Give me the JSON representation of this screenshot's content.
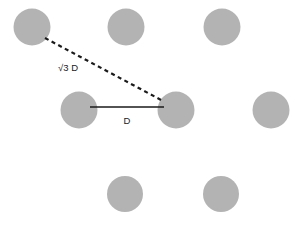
{
  "figure": {
    "title": "",
    "background_color": "#ffffff",
    "width": 305,
    "height": 226
  },
  "style": {
    "atom_fill": "#b3b3b3",
    "atom_stroke": "none",
    "solid_line_color": "#1a1a1a",
    "dashed_line_color": "#1a1a1a",
    "solid_line_width": 1.6,
    "dashed_line_width": 2.2,
    "dash_pattern": "4,3.5",
    "label_color": "#1a1a1a",
    "label_font_size": 9.5
  },
  "chart_data": {
    "type": "scatter",
    "title": "",
    "xlabel": "",
    "ylabel": "",
    "atoms": [
      {
        "id": "a1",
        "row": "top",
        "cx": 32,
        "cy": 27,
        "r": 18.5
      },
      {
        "id": "a2",
        "row": "top",
        "cx": 126,
        "cy": 27,
        "r": 18.5
      },
      {
        "id": "a3",
        "row": "top",
        "cx": 222,
        "cy": 27,
        "r": 18.5
      },
      {
        "id": "a4",
        "row": "middle",
        "cx": 79,
        "cy": 110,
        "r": 18.5
      },
      {
        "id": "a5",
        "row": "middle",
        "cx": 176,
        "cy": 110,
        "r": 18.5
      },
      {
        "id": "a6",
        "row": "middle",
        "cx": 271,
        "cy": 110,
        "r": 18.5
      },
      {
        "id": "a7",
        "row": "bottom",
        "cx": 125,
        "cy": 194,
        "r": 18.0
      },
      {
        "id": "a8",
        "row": "bottom",
        "cx": 221,
        "cy": 194,
        "r": 18.0
      }
    ],
    "measurements": [
      {
        "id": "m-diagonal",
        "label": "√3 D",
        "style": "dashed",
        "from_atom": "a1",
        "to_atom": "a5",
        "x1": 45,
        "y1": 38,
        "x2": 163,
        "y2": 101,
        "label_x": 68,
        "label_y": 71
      },
      {
        "id": "m-horizontal",
        "label": "D",
        "style": "solid",
        "from_atom": "a4",
        "to_atom": "a5",
        "x1": 90,
        "y1": 107,
        "x2": 164,
        "y2": 107,
        "label_x": 127,
        "label_y": 124
      }
    ]
  }
}
